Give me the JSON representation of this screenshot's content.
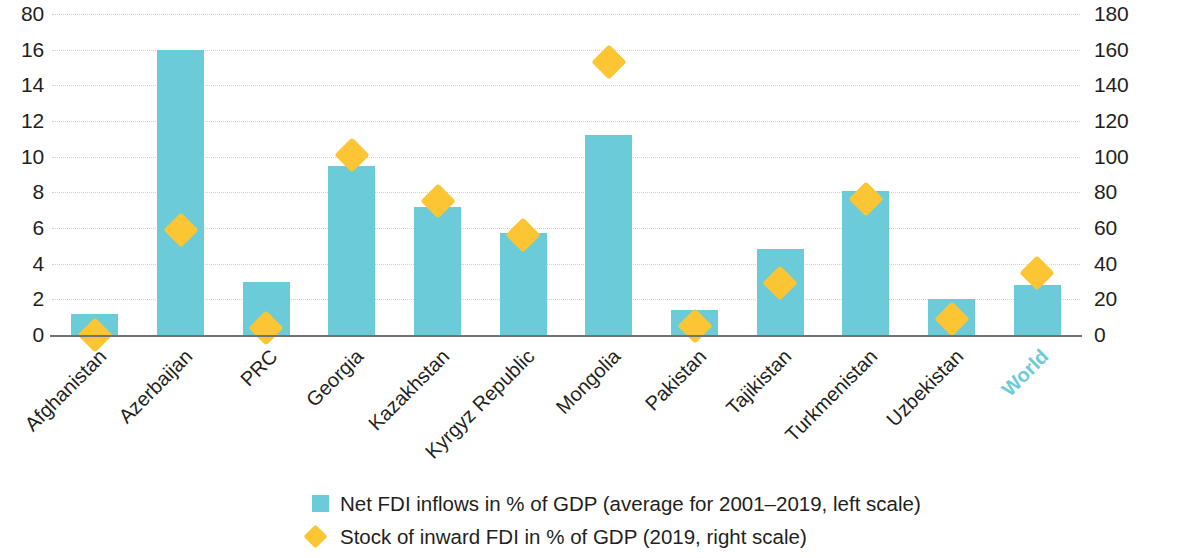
{
  "chart_data": {
    "type": "bar",
    "title": "",
    "subtitle": "",
    "xlabel": "",
    "ylabel": "",
    "grid": true,
    "legend_position": "bottom",
    "categories": [
      "Afghanistan",
      "Azerbaijan",
      "PRC",
      "Georgia",
      "Kazakhstan",
      "Kyrgyz Republic",
      "Mongolia",
      "Pakistan",
      "Tajikistan",
      "Turkmenistan",
      "Uzbekistan",
      "World"
    ],
    "highlight_category": "World",
    "left_axis": {
      "label": "",
      "ticks": [
        "80",
        "16",
        "14",
        "12",
        "10",
        "8",
        "6",
        "4",
        "2",
        "0"
      ],
      "tick_values": [
        18,
        16,
        14,
        12,
        10,
        8,
        6,
        4,
        2,
        0
      ],
      "ylim": [
        0,
        18
      ]
    },
    "right_axis": {
      "label": "",
      "ticks": [
        "180",
        "160",
        "140",
        "120",
        "100",
        "80",
        "60",
        "40",
        "20",
        "0"
      ],
      "tick_values": [
        180,
        160,
        140,
        120,
        100,
        80,
        60,
        40,
        20,
        0
      ],
      "ylim": [
        0,
        180
      ]
    },
    "series": [
      {
        "name": "Net FDI inflows in % of GDP (average for 2001–2019, left scale)",
        "type": "bar",
        "axis": "left",
        "color": "#6ccbd8",
        "values": [
          1.2,
          16.0,
          3.0,
          9.5,
          7.2,
          5.7,
          11.2,
          1.4,
          4.8,
          8.1,
          2.0,
          2.8
        ]
      },
      {
        "name": "Stock of inward FDI in % of GDP (2019, right scale)",
        "type": "scatter",
        "marker": "diamond",
        "axis": "right",
        "color": "#fbc534",
        "values": [
          7,
          66,
          11,
          108,
          82,
          63,
          160,
          12,
          36,
          83,
          16,
          42
        ]
      }
    ]
  },
  "legend": {
    "items": [
      {
        "marker": "square",
        "color": "#6ccbd8",
        "label": "Net FDI inflows in % of GDP (average for 2001–2019, left scale)"
      },
      {
        "marker": "diamond",
        "color": "#fbc534",
        "label": "Stock of inward FDI in % of GDP (2019, right scale)"
      }
    ]
  }
}
